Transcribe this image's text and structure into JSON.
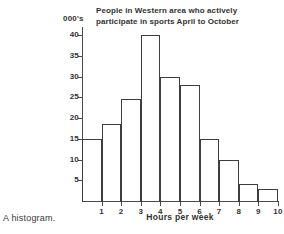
{
  "figure": {
    "caption": "A histogram."
  },
  "chart_data": {
    "type": "bar",
    "title": "People in Western area who actively participate in sports April to October",
    "title_lines": [
      "People in Western area who actively",
      "participate in sports  April to October"
    ],
    "xlabel": "Hours per week",
    "ylabel": "000's",
    "ylim": [
      0,
      42
    ],
    "xlim": [
      0,
      10
    ],
    "grid": false,
    "legend": null,
    "y_ticks": [
      5,
      10,
      15,
      20,
      25,
      30,
      35,
      40
    ],
    "y_tick_labels": [
      "5",
      "10",
      "15",
      "20",
      "25",
      "30",
      "35",
      "40"
    ],
    "x_ticks": [
      1,
      2,
      3,
      4,
      5,
      6,
      7,
      8,
      9,
      10
    ],
    "x_tick_labels": [
      "1",
      "2",
      "3",
      "4",
      "5",
      "6",
      "7",
      "8",
      "9",
      "10"
    ],
    "bin_edges": [
      0,
      1,
      2,
      3,
      4,
      5,
      6,
      7,
      8,
      9,
      10
    ],
    "categories": [
      "0-1",
      "1-2",
      "2-3",
      "3-4",
      "4-5",
      "5-6",
      "6-7",
      "7-8",
      "8-9",
      "9-10"
    ],
    "values": [
      15,
      18.5,
      24.7,
      40,
      30,
      28,
      15,
      10,
      4,
      3
    ],
    "bar_fill": "none",
    "bar_outline_color": "#3d3d3d",
    "axis_color": "#4a4a4a",
    "background": "#ffffff"
  }
}
